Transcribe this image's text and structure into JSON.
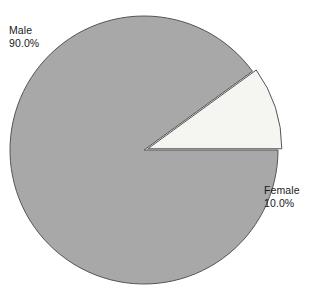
{
  "chart_data": {
    "type": "pie",
    "title": "",
    "subtitle": "",
    "xlabel": "",
    "ylabel": "",
    "grid": false,
    "legend_position": "none",
    "labels_outside": true,
    "categories": [
      "Male",
      "Female"
    ],
    "values": [
      90.0,
      10.0
    ],
    "value_unit": "%",
    "slices": [
      {
        "name": "Male",
        "value": 90.0,
        "value_label": "90.0%",
        "color": "#a8a8a8",
        "stroke": "#555555",
        "exploded": false,
        "start_angle_deg": 36,
        "end_angle_deg": 360,
        "label_position": "upper-left"
      },
      {
        "name": "Female",
        "value": 10.0,
        "value_label": "10.0%",
        "color": "#f5f5f2",
        "stroke": "#555555",
        "exploded": true,
        "start_angle_deg": 0,
        "end_angle_deg": 36,
        "label_position": "right"
      }
    ],
    "geometry": {
      "center_x": 144,
      "center_y": 150,
      "radius": 134,
      "explode_offset": 4
    },
    "background_color": "#ffffff",
    "text_color": "#1a1a1a"
  },
  "labels": {
    "male": {
      "name": "Male",
      "percent": "90.0%"
    },
    "female": {
      "name": "Female",
      "percent": "10.0%"
    }
  }
}
